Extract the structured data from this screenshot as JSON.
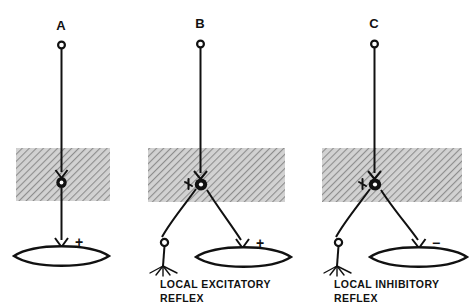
{
  "figure": {
    "background_color": "#ffffff",
    "ink_color": "#111111",
    "band_fill_color": "#c9c9c9",
    "band_hatch_color": "#8a8a8a"
  },
  "panels": [
    {
      "id": "A",
      "label": "A",
      "caption_line1": "",
      "caption_line2": "",
      "effector_sign": "+",
      "sign_meaning": "excitatory",
      "has_sensory_branch": false,
      "has_interneuron": false,
      "description": "Descending fiber synapsing directly on motor neuron in gray matter, motor axon to effector"
    },
    {
      "id": "B",
      "label": "B",
      "caption_line1": "LOCAL  EXCITATORY",
      "caption_line2": "REFLEX",
      "effector_sign": "+",
      "sign_meaning": "excitatory",
      "has_sensory_branch": true,
      "has_interneuron": true,
      "description": "Descending fiber and sensory afferent converging on motor neuron producing excitation of effector"
    },
    {
      "id": "C",
      "label": "C",
      "caption_line1": "LOCAL  INHIBITORY",
      "caption_line2": "REFLEX",
      "effector_sign": "−",
      "sign_meaning": "inhibitory",
      "has_sensory_branch": true,
      "has_interneuron": true,
      "description": "Descending fiber and sensory afferent converging on motor neuron producing inhibition of effector"
    }
  ],
  "elements": {
    "gray_matter_band": "gray-matter-band",
    "descending_fiber": "descending-fiber",
    "fiber_origin_marker": "fiber-origin-circle",
    "synaptic_terminal": "synaptic-terminal",
    "motor_neuron_soma": "motor-neuron-soma",
    "motor_neuron_nucleus": "motor-neuron-nucleus",
    "motor_axon": "motor-axon",
    "sensory_axon": "sensory-axon",
    "dorsal_root_ganglion": "dorsal-root-ganglion-circle",
    "sensory_receptor": "sensory-receptor-ending",
    "effector_organ": "effector-organ",
    "inhibitory_bouton": "inhibitory-bouton"
  }
}
